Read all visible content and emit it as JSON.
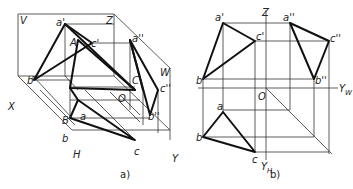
{
  "figure_a": {
    "caption": "a)",
    "labels": {
      "V": "V",
      "Z": "Z",
      "W": "W",
      "X": "X",
      "Y": "Y",
      "H": "H",
      "O": "O",
      "A": "A",
      "B": "B",
      "C": "C",
      "a_prime": "a'",
      "b_prime": "b'",
      "c_prime": "c'",
      "a_dprime": "a''",
      "b_dprime": "b''",
      "c_dprime": "c''",
      "a": "a",
      "b": "b",
      "c": "c"
    }
  },
  "figure_b": {
    "caption": "b)",
    "labels": {
      "Z": "Z",
      "O": "O",
      "Y_W": "Y",
      "Y_W_sub": "W",
      "Y_H": "Y",
      "Y_H_sub": "H",
      "a_prime": "a'",
      "b_prime": "b'",
      "c_prime": "c'",
      "a_dprime": "a''",
      "b_dprime": "b''",
      "c_dprime": "c''",
      "a": "a",
      "b": "b",
      "c": "c"
    }
  },
  "colors": {
    "line": "#111111",
    "thin_line": "#333333",
    "background": "#ffffff"
  }
}
